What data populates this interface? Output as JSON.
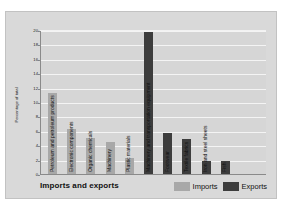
{
  "chart_data": {
    "type": "bar",
    "title": "Imports and exports",
    "xlabel": "",
    "ylabel": "Percentage of total",
    "ylim": [
      0,
      20
    ],
    "ytick_labels": [
      "0",
      "2",
      "4",
      "6",
      "8",
      "10",
      "12",
      "14",
      "16",
      "18",
      "20"
    ],
    "yticks": [
      0,
      2,
      4,
      6,
      8,
      10,
      12,
      14,
      16,
      18,
      20
    ],
    "grid": true,
    "legend_position": "bottom-right",
    "categories": [
      "Petroleum and petroleum products",
      "Electronic components",
      "Organic chemicals",
      "Machinery",
      "Plastic materials",
      "Machinery and transportation equipment",
      "Footwear",
      "Textile fabrics",
      "Iron and steel sheets",
      "Fish"
    ],
    "series": [
      {
        "name": "Imports",
        "color": "#a8a8a8",
        "values": [
          11.3,
          6.2,
          5.0,
          4.5,
          2.2,
          null,
          null,
          null,
          null,
          null
        ]
      },
      {
        "name": "Exports",
        "color": "#3d3d3d",
        "values": [
          null,
          null,
          null,
          null,
          null,
          19.7,
          5.7,
          4.9,
          1.8,
          1.8
        ]
      }
    ],
    "bars": [
      {
        "category": "Petroleum and petroleum products",
        "series": "Imports",
        "value": 11.3
      },
      {
        "category": "Electronic components",
        "series": "Imports",
        "value": 6.2
      },
      {
        "category": "Organic chemicals",
        "series": "Imports",
        "value": 5.0
      },
      {
        "category": "Machinery",
        "series": "Imports",
        "value": 4.5
      },
      {
        "category": "Plastic materials",
        "series": "Imports",
        "value": 2.2
      },
      {
        "category": "Machinery and transportation equipment",
        "series": "Exports",
        "value": 19.7
      },
      {
        "category": "Footwear",
        "series": "Exports",
        "value": 5.7
      },
      {
        "category": "Textile fabrics",
        "series": "Exports",
        "value": 4.9
      },
      {
        "category": "Iron and steel sheets",
        "series": "Exports",
        "value": 1.8
      },
      {
        "category": "Fish",
        "series": "Exports",
        "value": 1.8
      }
    ]
  },
  "legend": {
    "items": [
      {
        "label": "Imports",
        "color": "#a8a8a8"
      },
      {
        "label": "Exports",
        "color": "#3d3d3d"
      }
    ]
  }
}
